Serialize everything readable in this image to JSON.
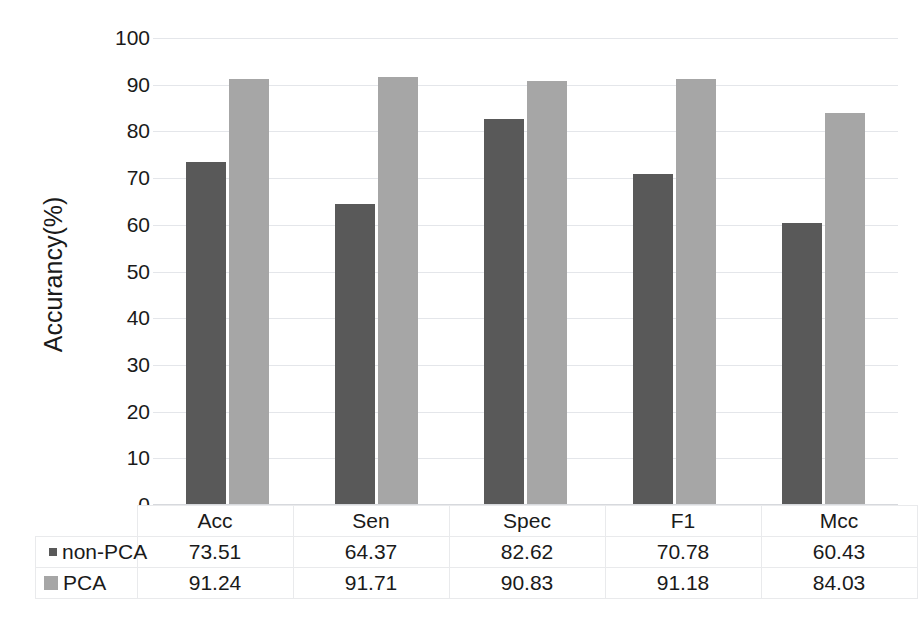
{
  "chart_data": {
    "type": "bar",
    "title": "",
    "xlabel": "",
    "ylabel": "Accurancy(%)",
    "ylim": [
      0,
      100
    ],
    "yticks": [
      100,
      90,
      80,
      70,
      60,
      50,
      40,
      30,
      20,
      10,
      0
    ],
    "grid": true,
    "legend_position": "data-table-left",
    "categories": [
      "Acc",
      "Sen",
      "Spec",
      "F1",
      "Mcc"
    ],
    "series": [
      {
        "name": "non-PCA",
        "color": "#595959",
        "swatch": "small-dark-square",
        "values": [
          73.51,
          64.37,
          82.62,
          70.78,
          60.43
        ],
        "labels": [
          "73.51",
          "64.37",
          "82.62",
          "70.78",
          "60.43"
        ]
      },
      {
        "name": "PCA",
        "color": "#a6a6a6",
        "swatch": "large-gray-square",
        "values": [
          91.24,
          91.71,
          90.83,
          91.18,
          84.03
        ],
        "labels": [
          "91.24",
          "91.71",
          "90.83",
          "91.18",
          "84.03"
        ]
      }
    ]
  },
  "table": {
    "header": [
      "",
      "Acc",
      "Sen",
      "Spec",
      "F1",
      "Mcc"
    ],
    "rows": [
      {
        "label": "non-PCA",
        "cells": [
          "73.51",
          "64.37",
          "82.62",
          "70.78",
          "60.43"
        ]
      },
      {
        "label": "PCA",
        "cells": [
          "91.24",
          "91.71",
          "90.83",
          "91.18",
          "84.03"
        ]
      }
    ]
  },
  "colors": {
    "series_non_pca": "#595959",
    "series_pca": "#a6a6a6",
    "gridline": "#e4e6ea",
    "table_border": "#e9eaec",
    "text": "#1a1a1a",
    "background": "#ffffff"
  }
}
